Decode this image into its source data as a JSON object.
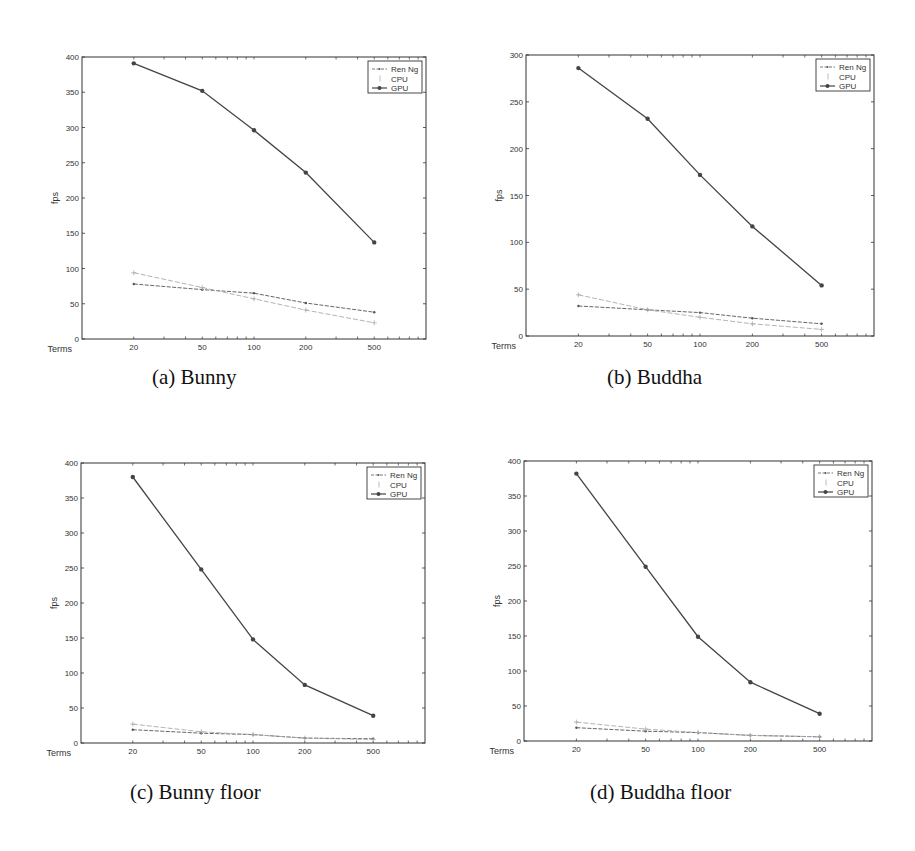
{
  "figure": {
    "captions": [
      "(a) Bunny",
      "(b) Buddha",
      "(c) Bunny floor",
      "(d) Buddha floor"
    ]
  },
  "colors": {
    "axis": "#333333",
    "ren_ng": "#555555",
    "cpu": "#aaaaaa",
    "gpu": "#444444"
  },
  "chart_data": [
    {
      "type": "line",
      "title": "(a) Bunny",
      "xlabel": "Terms",
      "ylabel": "fps",
      "xscale": "log",
      "categories": [
        20,
        50,
        100,
        200,
        500
      ],
      "x": [
        20,
        50,
        100,
        200,
        500
      ],
      "xticks": [
        "20",
        "50",
        "100",
        "200",
        "500"
      ],
      "ylim": [
        0,
        400
      ],
      "yticks": [
        0,
        50,
        100,
        150,
        200,
        250,
        300,
        350,
        400
      ],
      "grid": false,
      "legend_position": "upper right",
      "series": [
        {
          "name": "Ren Ng",
          "values": [
            78,
            70,
            65,
            51,
            38
          ]
        },
        {
          "name": "CPU",
          "values": [
            94,
            73,
            57,
            41,
            23
          ]
        },
        {
          "name": "GPU",
          "values": [
            391,
            352,
            296,
            236,
            137
          ]
        }
      ]
    },
    {
      "type": "line",
      "title": "(b) Buddha",
      "xlabel": "Terms",
      "ylabel": "fps",
      "xscale": "log",
      "categories": [
        20,
        50,
        100,
        200,
        500
      ],
      "x": [
        20,
        50,
        100,
        200,
        500
      ],
      "xticks": [
        "20",
        "50",
        "100",
        "200",
        "500"
      ],
      "ylim": [
        0,
        300
      ],
      "yticks": [
        0,
        50,
        100,
        150,
        200,
        250,
        300
      ],
      "grid": false,
      "legend_position": "upper right",
      "series": [
        {
          "name": "Ren Ng",
          "values": [
            32,
            28,
            25,
            19,
            13
          ]
        },
        {
          "name": "CPU",
          "values": [
            44,
            28,
            20,
            13,
            7
          ]
        },
        {
          "name": "GPU",
          "values": [
            286,
            232,
            172,
            117,
            54
          ]
        }
      ]
    },
    {
      "type": "line",
      "title": "(c) Bunny floor",
      "xlabel": "Terms",
      "ylabel": "fps",
      "xscale": "log",
      "categories": [
        20,
        50,
        100,
        200,
        500
      ],
      "x": [
        20,
        50,
        100,
        200,
        500
      ],
      "xticks": [
        "20",
        "50",
        "100",
        "200",
        "500"
      ],
      "ylim": [
        0,
        400
      ],
      "yticks": [
        0,
        50,
        100,
        150,
        200,
        250,
        300,
        350,
        400
      ],
      "grid": false,
      "legend_position": "upper right",
      "series": [
        {
          "name": "Ren Ng",
          "values": [
            19,
            14,
            12,
            7,
            6
          ]
        },
        {
          "name": "CPU",
          "values": [
            27,
            16,
            12,
            7,
            5
          ]
        },
        {
          "name": "GPU",
          "values": [
            380,
            248,
            148,
            83,
            39
          ]
        }
      ]
    },
    {
      "type": "line",
      "title": "(d) Buddha floor",
      "xlabel": "Terms",
      "ylabel": "fps",
      "xscale": "log",
      "categories": [
        20,
        50,
        100,
        200,
        500
      ],
      "x": [
        20,
        50,
        100,
        200,
        500
      ],
      "xticks": [
        "20",
        "50",
        "100",
        "200",
        "500"
      ],
      "ylim": [
        0,
        400
      ],
      "yticks": [
        0,
        50,
        100,
        150,
        200,
        250,
        300,
        350,
        400
      ],
      "grid": false,
      "legend_position": "upper right",
      "series": [
        {
          "name": "Ren Ng",
          "values": [
            19,
            14,
            12,
            8,
            6
          ]
        },
        {
          "name": "CPU",
          "values": [
            27,
            17,
            12,
            8,
            6
          ]
        },
        {
          "name": "GPU",
          "values": [
            382,
            249,
            149,
            84,
            39
          ]
        }
      ]
    }
  ]
}
